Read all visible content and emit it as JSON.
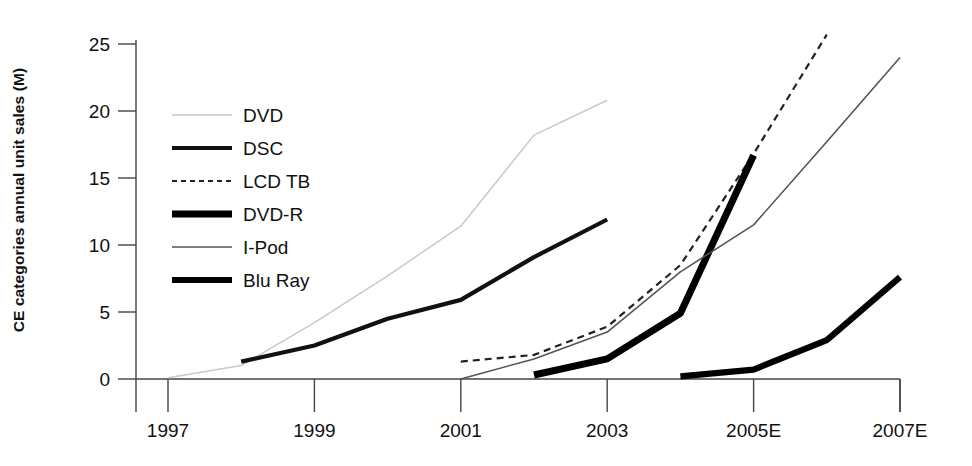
{
  "chart_data": {
    "type": "line",
    "title": "",
    "xlabel": "",
    "ylabel": "CE categories annual unit sales (M)",
    "xlim": [
      1996.5,
      2007.5
    ],
    "ylim": [
      0,
      25
    ],
    "grid": false,
    "legend_position": "upper-left-inside",
    "x_ticks": [
      "1997",
      "1999",
      "2001",
      "2003",
      "2005E",
      "2007E"
    ],
    "x_tick_values": [
      1997,
      1999,
      2001,
      2003,
      2005,
      2007
    ],
    "y_ticks": [
      "0",
      "5",
      "10",
      "15",
      "20",
      "25"
    ],
    "y_tick_values": [
      0,
      5,
      10,
      15,
      20,
      25
    ],
    "series": [
      {
        "name": "DVD",
        "style": "thin-light-gray",
        "color": "#c9c9c9",
        "width": 1.5,
        "dash": "none",
        "x": [
          1997,
          1998,
          1999,
          2000,
          2001,
          2002,
          2003
        ],
        "values": [
          0.1,
          1.0,
          4.2,
          7.7,
          11.4,
          18.2,
          20.8
        ]
      },
      {
        "name": "DSC",
        "style": "medium-black",
        "color": "#111111",
        "width": 4.2,
        "dash": "none",
        "x": [
          1998,
          1999,
          2000,
          2001,
          2002,
          2003
        ],
        "values": [
          1.3,
          2.5,
          4.5,
          5.9,
          9.1,
          11.9
        ]
      },
      {
        "name": "LCD TB",
        "style": "dashed-black",
        "color": "#222222",
        "width": 2.2,
        "dash": "7,5",
        "x": [
          2001,
          2002,
          2003,
          2004,
          2005,
          2006
        ],
        "values": [
          1.3,
          1.8,
          3.9,
          8.5,
          16.8,
          25.7
        ]
      },
      {
        "name": "DVD-R",
        "style": "thick-black",
        "color": "#000000",
        "width": 7.0,
        "dash": "none",
        "x": [
          2002,
          2003,
          2004,
          2005
        ],
        "values": [
          0.3,
          1.5,
          4.9,
          16.7
        ]
      },
      {
        "name": "I-Pod",
        "style": "thin-black",
        "color": "#555555",
        "width": 1.6,
        "dash": "none",
        "x": [
          2001,
          2002,
          2003,
          2004,
          2005,
          2006,
          2007
        ],
        "values": [
          0.0,
          1.5,
          3.5,
          8.0,
          11.5,
          17.7,
          24.0
        ]
      },
      {
        "name": "Blu Ray",
        "style": "thick-black",
        "color": "#000000",
        "width": 6.2,
        "dash": "none",
        "x": [
          2004,
          2005,
          2006,
          2007
        ],
        "values": [
          0.2,
          0.7,
          2.9,
          7.6
        ]
      }
    ],
    "legend_entries": [
      {
        "label": "DVD",
        "color": "#c9c9c9",
        "width": 1.5,
        "dash": "none"
      },
      {
        "label": "DSC",
        "color": "#111111",
        "width": 4.2,
        "dash": "none"
      },
      {
        "label": "LCD TB",
        "color": "#222222",
        "width": 2.2,
        "dash": "5,4"
      },
      {
        "label": "DVD-R",
        "color": "#000000",
        "width": 7.0,
        "dash": "none"
      },
      {
        "label": "I-Pod",
        "color": "#555555",
        "width": 1.6,
        "dash": "none"
      },
      {
        "label": "Blu Ray",
        "color": "#000000",
        "width": 6.2,
        "dash": "none"
      }
    ]
  }
}
